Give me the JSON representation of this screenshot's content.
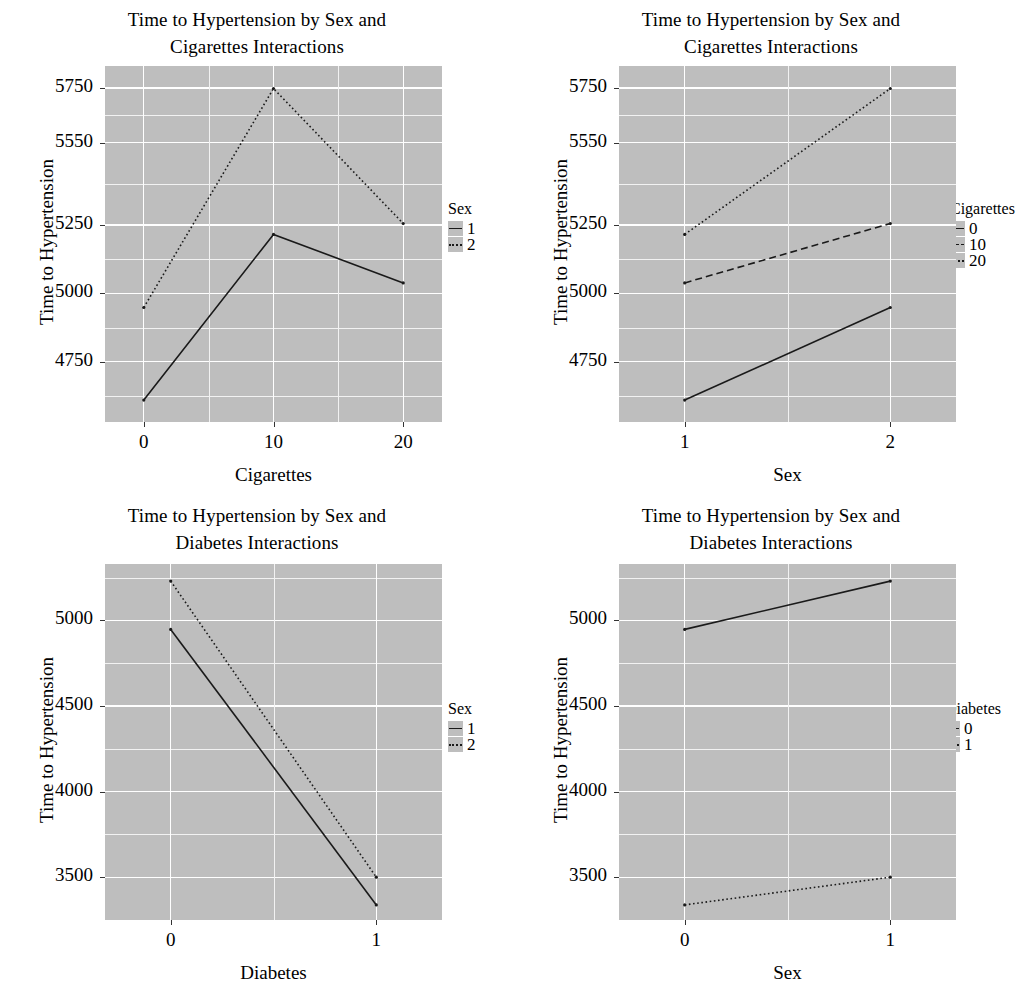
{
  "figure": {
    "font_color": "#000000",
    "panel_background": "#bebebe",
    "gridline_color": "#ffffff",
    "line_color": "#1a1a1a"
  },
  "chart_data": [
    {
      "id": "panel-top-left",
      "type": "line",
      "title": "Time to Hypertension by Sex and Cigarettes Interactions",
      "title_line1": "Time to Hypertension by Sex and",
      "title_line2": "Cigarettes Interactions",
      "xlabel": "Cigarettes",
      "ylabel": "Time to Hypertension",
      "x": [
        0,
        10,
        20
      ],
      "xticks": [
        "0",
        "10",
        "20"
      ],
      "yticks": [
        "5750",
        "5550",
        "5250",
        "5000",
        "4750"
      ],
      "ytick_values": [
        5750,
        5550,
        5250,
        5000,
        4750
      ],
      "ylim": [
        4530,
        5830
      ],
      "legend": {
        "title": "Sex",
        "position": "right",
        "entries": [
          "1",
          "2"
        ]
      },
      "series": [
        {
          "name": "1",
          "linetype": "solid",
          "values": [
            4610,
            5215,
            5038
          ]
        },
        {
          "name": "2",
          "linetype": "dotted",
          "values": [
            4948,
            5748,
            5255
          ]
        }
      ]
    },
    {
      "id": "panel-top-right",
      "type": "line",
      "title": "Time to Hypertension by Sex and Cigarettes Interactions",
      "title_line1": "Time to Hypertension by Sex and",
      "title_line2": "Cigarettes Interactions",
      "xlabel": "Sex",
      "ylabel": "Time to Hypertension",
      "x": [
        1,
        2
      ],
      "xticks": [
        "1",
        "2"
      ],
      "yticks": [
        "5750",
        "5550",
        "5250",
        "5000",
        "4750"
      ],
      "ytick_values": [
        5750,
        5550,
        5250,
        5000,
        4750
      ],
      "ylim": [
        4530,
        5830
      ],
      "legend": {
        "title": "Cigarettes",
        "position": "right",
        "entries": [
          "0",
          "10",
          "20"
        ]
      },
      "series": [
        {
          "name": "0",
          "linetype": "solid",
          "values": [
            4610,
            4948
          ]
        },
        {
          "name": "10",
          "linetype": "dashed",
          "values": [
            5038,
            5255
          ]
        },
        {
          "name": "20",
          "linetype": "dotted",
          "values": [
            5215,
            5748
          ]
        }
      ]
    },
    {
      "id": "panel-bottom-left",
      "type": "line",
      "title": "Time to Hypertension by Sex and Diabetes Interactions",
      "title_line1": "Time to Hypertension by Sex and",
      "title_line2": "Diabetes Interactions",
      "xlabel": "Diabetes",
      "ylabel": "Time to Hypertension",
      "x": [
        0,
        1
      ],
      "xticks": [
        "0",
        "1"
      ],
      "yticks": [
        "5000",
        "4500",
        "4000",
        "3500"
      ],
      "ytick_values": [
        5000,
        4500,
        4000,
        3500
      ],
      "ylim": [
        3250,
        5330
      ],
      "legend": {
        "title": "Sex",
        "position": "right",
        "entries": [
          "1",
          "2"
        ]
      },
      "series": [
        {
          "name": "1",
          "linetype": "solid",
          "values": [
            4948,
            3338
          ]
        },
        {
          "name": "2",
          "linetype": "dotted",
          "values": [
            5230,
            3500
          ]
        }
      ]
    },
    {
      "id": "panel-bottom-right",
      "type": "line",
      "title": "Time to Hypertension by Sex and Diabetes Interactions",
      "title_line1": "Time to Hypertension by Sex and",
      "title_line2": "Diabetes Interactions",
      "xlabel": "Sex",
      "ylabel": "Time to Hypertension",
      "x": [
        0,
        1
      ],
      "xticks": [
        "0",
        "1"
      ],
      "yticks": [
        "5000",
        "4500",
        "4000",
        "3500"
      ],
      "ytick_values": [
        5000,
        4500,
        4000,
        3500
      ],
      "ylim": [
        3250,
        5330
      ],
      "legend": {
        "title": "Diabetes",
        "position": "right",
        "entries": [
          "0",
          "1"
        ]
      },
      "series": [
        {
          "name": "0",
          "linetype": "solid",
          "values": [
            4948,
            5230
          ]
        },
        {
          "name": "1",
          "linetype": "dotted",
          "values": [
            3338,
            3500
          ]
        }
      ]
    }
  ]
}
